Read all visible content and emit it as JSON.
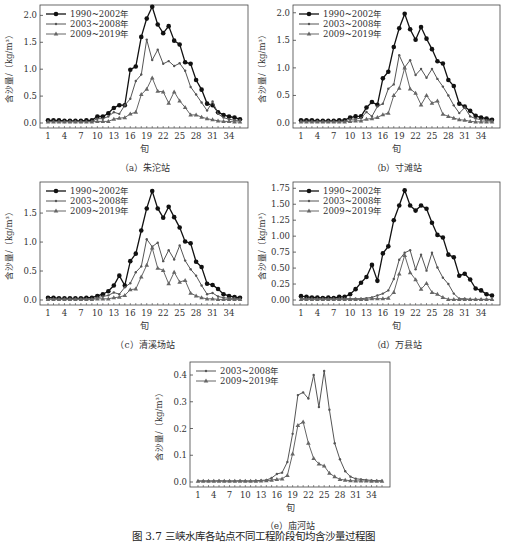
{
  "figure_caption": "图 3.7  三峡水库各站点不同工程阶段旬均含沙量过程图",
  "chart_data": [
    {
      "id": "a",
      "type": "line",
      "subtitle": "（a）朱沱站",
      "xlabel": "旬",
      "ylabel": "含沙量/（kg/m³）",
      "ylim": [
        0,
        2.1
      ],
      "yticks": [
        0.0,
        0.5,
        1.0,
        1.5,
        2.0
      ],
      "ytick_labels": [
        "0.0",
        "0.5",
        "1.0",
        "1.5",
        "2.0"
      ],
      "xticks": [
        1,
        4,
        7,
        10,
        13,
        16,
        19,
        22,
        25,
        28,
        31,
        34
      ],
      "x": [
        1,
        2,
        3,
        4,
        5,
        6,
        7,
        8,
        9,
        10,
        11,
        12,
        13,
        14,
        15,
        16,
        17,
        18,
        19,
        20,
        21,
        22,
        23,
        24,
        25,
        26,
        27,
        28,
        29,
        30,
        31,
        32,
        33,
        34,
        35,
        36
      ],
      "legend_position": "upper left",
      "grid": false,
      "series": [
        {
          "name": "1990~2002年",
          "marker": "circle",
          "values": [
            0.05,
            0.05,
            0.05,
            0.04,
            0.04,
            0.04,
            0.04,
            0.05,
            0.05,
            0.12,
            0.12,
            0.18,
            0.28,
            0.33,
            0.33,
            0.99,
            1.05,
            1.6,
            1.94,
            2.16,
            1.83,
            1.67,
            1.8,
            1.53,
            1.46,
            1.13,
            1.1,
            0.8,
            0.62,
            0.36,
            0.33,
            0.2,
            0.15,
            0.12,
            0.1,
            0.07
          ]
        },
        {
          "name": "2003~2008年",
          "marker": "small-dot",
          "values": [
            0.03,
            0.03,
            0.03,
            0.03,
            0.03,
            0.03,
            0.03,
            0.03,
            0.03,
            0.08,
            0.08,
            0.12,
            0.2,
            0.17,
            0.33,
            0.45,
            0.78,
            0.9,
            1.55,
            1.17,
            1.36,
            1.1,
            1.15,
            1.06,
            1.11,
            0.97,
            0.67,
            0.53,
            0.38,
            0.23,
            0.4,
            0.17,
            0.1,
            0.07,
            0.05,
            0.05
          ]
        },
        {
          "name": "2009~2019年",
          "marker": "triangle",
          "values": [
            0.02,
            0.02,
            0.02,
            0.02,
            0.02,
            0.02,
            0.02,
            0.02,
            0.02,
            0.03,
            0.03,
            0.03,
            0.07,
            0.09,
            0.1,
            0.17,
            0.2,
            0.53,
            0.63,
            0.84,
            0.59,
            0.58,
            0.37,
            0.58,
            0.41,
            0.29,
            0.15,
            0.15,
            0.11,
            0.08,
            0.06,
            0.04,
            0.03,
            0.03,
            0.02,
            0.02
          ]
        }
      ]
    },
    {
      "id": "b",
      "type": "line",
      "subtitle": "（b）寸滩站",
      "xlabel": "旬",
      "ylabel": "含沙量/（kg/m³）",
      "ylim": [
        0,
        2.05
      ],
      "yticks": [
        0.0,
        0.5,
        1.0,
        1.5,
        2.0
      ],
      "ytick_labels": [
        "0.0",
        "0.5",
        "1.0",
        "1.5",
        "2.0"
      ],
      "xticks": [
        1,
        4,
        7,
        10,
        13,
        16,
        19,
        22,
        25,
        28,
        31,
        34
      ],
      "x": [
        1,
        2,
        3,
        4,
        5,
        6,
        7,
        8,
        9,
        10,
        11,
        12,
        13,
        14,
        15,
        16,
        17,
        18,
        19,
        20,
        21,
        22,
        23,
        24,
        25,
        26,
        27,
        28,
        29,
        30,
        31,
        32,
        33,
        34,
        35,
        36
      ],
      "legend_position": "upper left",
      "grid": false,
      "series": [
        {
          "name": "1990~2002年",
          "marker": "circle",
          "values": [
            0.05,
            0.05,
            0.05,
            0.04,
            0.04,
            0.04,
            0.04,
            0.05,
            0.05,
            0.1,
            0.12,
            0.12,
            0.28,
            0.38,
            0.33,
            0.81,
            0.93,
            1.38,
            1.72,
            1.98,
            1.7,
            1.51,
            1.74,
            1.53,
            1.34,
            1.12,
            1.08,
            0.78,
            0.67,
            0.35,
            0.3,
            0.22,
            0.13,
            0.1,
            0.08,
            0.06
          ]
        },
        {
          "name": "2003~2008年",
          "marker": "small-dot",
          "values": [
            0.03,
            0.03,
            0.03,
            0.03,
            0.03,
            0.03,
            0.03,
            0.03,
            0.03,
            0.07,
            0.07,
            0.09,
            0.2,
            0.12,
            0.3,
            0.35,
            0.62,
            0.7,
            1.23,
            1.01,
            1.14,
            0.87,
            0.98,
            0.82,
            0.98,
            0.8,
            0.66,
            0.5,
            0.32,
            0.18,
            0.28,
            0.12,
            0.08,
            0.06,
            0.05,
            0.04
          ]
        },
        {
          "name": "2009~2019年",
          "marker": "triangle",
          "values": [
            0.02,
            0.02,
            0.02,
            0.02,
            0.02,
            0.02,
            0.02,
            0.02,
            0.02,
            0.03,
            0.04,
            0.04,
            0.07,
            0.08,
            0.1,
            0.15,
            0.18,
            0.5,
            0.63,
            1.0,
            0.62,
            0.54,
            0.33,
            0.5,
            0.36,
            0.4,
            0.16,
            0.12,
            0.09,
            0.06,
            0.05,
            0.03,
            0.02,
            0.02,
            0.02,
            0.02
          ]
        }
      ]
    },
    {
      "id": "c",
      "type": "line",
      "subtitle": "（c）清溪场站",
      "xlabel": "旬",
      "ylabel": "含沙量/（kg/m³）",
      "ylim": [
        0,
        1.95
      ],
      "yticks": [
        0.0,
        0.5,
        1.0,
        1.5
      ],
      "ytick_labels": [
        "0.0",
        "0.5",
        "1.0",
        "1.5"
      ],
      "xticks": [
        1,
        4,
        7,
        10,
        13,
        16,
        19,
        22,
        25,
        28,
        31,
        34
      ],
      "x": [
        1,
        2,
        3,
        4,
        5,
        6,
        7,
        8,
        9,
        10,
        11,
        12,
        13,
        14,
        15,
        16,
        17,
        18,
        19,
        20,
        21,
        22,
        23,
        24,
        25,
        26,
        27,
        28,
        29,
        30,
        31,
        32,
        33,
        34,
        35,
        36
      ],
      "legend_position": "upper left",
      "grid": false,
      "series": [
        {
          "name": "1990~2002年",
          "marker": "circle",
          "values": [
            0.04,
            0.04,
            0.03,
            0.03,
            0.03,
            0.03,
            0.03,
            0.04,
            0.04,
            0.07,
            0.1,
            0.15,
            0.25,
            0.42,
            0.25,
            0.67,
            0.8,
            1.2,
            1.58,
            1.88,
            1.58,
            1.42,
            1.61,
            1.43,
            1.25,
            1.01,
            0.98,
            0.66,
            0.57,
            0.28,
            0.26,
            0.19,
            0.1,
            0.07,
            0.05,
            0.04
          ]
        },
        {
          "name": "2003~2008年",
          "marker": "small-dot",
          "values": [
            0.02,
            0.02,
            0.02,
            0.02,
            0.02,
            0.02,
            0.02,
            0.02,
            0.02,
            0.04,
            0.06,
            0.08,
            0.13,
            0.1,
            0.22,
            0.29,
            0.48,
            0.58,
            1.05,
            0.92,
            0.99,
            0.67,
            0.86,
            0.7,
            0.94,
            0.68,
            0.53,
            0.42,
            0.25,
            0.1,
            0.12,
            0.06,
            0.04,
            0.03,
            0.03,
            0.02
          ]
        },
        {
          "name": "2009~2019年",
          "marker": "triangle",
          "values": [
            0.01,
            0.01,
            0.01,
            0.01,
            0.01,
            0.01,
            0.01,
            0.01,
            0.01,
            0.02,
            0.02,
            0.02,
            0.04,
            0.05,
            0.08,
            0.18,
            0.19,
            0.4,
            0.6,
            0.9,
            0.55,
            0.51,
            0.28,
            0.48,
            0.31,
            0.34,
            0.12,
            0.07,
            0.04,
            0.02,
            0.02,
            0.01,
            0.01,
            0.01,
            0.01,
            0.01
          ]
        }
      ]
    },
    {
      "id": "d",
      "type": "line",
      "subtitle": "（d）万县站",
      "xlabel": "旬",
      "ylabel": "含沙量/（kg/m³）",
      "ylim": [
        0,
        1.77
      ],
      "yticks": [
        0.0,
        0.25,
        0.5,
        0.75,
        1.0,
        1.25,
        1.5,
        1.75
      ],
      "ytick_labels": [
        "0.00",
        "0.25",
        "0.50",
        "0.75",
        "1.00",
        "1.25",
        "1.50",
        "1.75"
      ],
      "xticks": [
        1,
        4,
        7,
        10,
        13,
        16,
        19,
        22,
        25,
        28,
        31,
        34
      ],
      "x": [
        1,
        2,
        3,
        4,
        5,
        6,
        7,
        8,
        9,
        10,
        11,
        12,
        13,
        14,
        15,
        16,
        17,
        18,
        19,
        20,
        21,
        22,
        23,
        24,
        25,
        26,
        27,
        28,
        29,
        30,
        31,
        32,
        33,
        34,
        35,
        36
      ],
      "legend_position": "upper left",
      "grid": false,
      "series": [
        {
          "name": "1990~2002年",
          "marker": "circle",
          "values": [
            0.06,
            0.05,
            0.04,
            0.04,
            0.03,
            0.04,
            0.03,
            0.05,
            0.05,
            0.09,
            0.17,
            0.27,
            0.36,
            0.55,
            0.3,
            0.73,
            0.84,
            1.25,
            1.48,
            1.72,
            1.48,
            1.4,
            1.48,
            1.43,
            1.21,
            1.02,
            0.98,
            0.71,
            0.67,
            0.38,
            0.41,
            0.32,
            0.18,
            0.15,
            0.09,
            0.07
          ]
        },
        {
          "name": "2003~2008年",
          "marker": "small-dot",
          "values": [
            0.02,
            0.02,
            0.02,
            0.02,
            0.02,
            0.02,
            0.02,
            0.02,
            0.02,
            0.02,
            0.02,
            0.02,
            0.03,
            0.04,
            0.07,
            0.1,
            0.15,
            0.33,
            0.63,
            0.74,
            0.78,
            0.48,
            0.71,
            0.46,
            0.74,
            0.51,
            0.35,
            0.25,
            0.1,
            0.02,
            0.02,
            0.01,
            0.01,
            0.01,
            0.01,
            0.01
          ]
        },
        {
          "name": "2009~2019年",
          "marker": "triangle",
          "values": [
            0.01,
            0.01,
            0.01,
            0.01,
            0.01,
            0.01,
            0.01,
            0.01,
            0.01,
            0.01,
            0.01,
            0.01,
            0.01,
            0.02,
            0.02,
            0.02,
            0.03,
            0.12,
            0.41,
            0.7,
            0.43,
            0.32,
            0.17,
            0.26,
            0.12,
            0.09,
            0.04,
            0.01,
            0.01,
            0.01,
            0.01,
            0.01,
            0.01,
            0.01,
            0.01,
            0.01
          ]
        }
      ]
    },
    {
      "id": "e",
      "type": "line",
      "subtitle": "（e）庙河站",
      "xlabel": "旬",
      "ylabel": "含沙量/（kg/m³）",
      "ylim": [
        0,
        0.43
      ],
      "yticks": [
        0.0,
        0.1,
        0.2,
        0.3,
        0.4
      ],
      "ytick_labels": [
        "0.0",
        "0.1",
        "0.2",
        "0.3",
        "0.4"
      ],
      "xticks": [
        1,
        4,
        7,
        10,
        13,
        16,
        19,
        22,
        25,
        28,
        31,
        34
      ],
      "x": [
        1,
        2,
        3,
        4,
        5,
        6,
        7,
        8,
        9,
        10,
        11,
        12,
        13,
        14,
        15,
        16,
        17,
        18,
        19,
        20,
        21,
        22,
        23,
        24,
        25,
        26,
        27,
        28,
        29,
        30,
        31,
        32,
        33,
        34,
        35,
        36
      ],
      "legend_position": "upper left",
      "grid": false,
      "series": [
        {
          "name": "2003~2008年",
          "marker": "small-dot",
          "values": [
            0.004,
            0.004,
            0.004,
            0.004,
            0.005,
            0.004,
            0.004,
            0.004,
            0.005,
            0.004,
            0.004,
            0.005,
            0.006,
            0.007,
            0.015,
            0.03,
            0.035,
            0.075,
            0.18,
            0.325,
            0.335,
            0.312,
            0.4,
            0.28,
            0.415,
            0.27,
            0.145,
            0.085,
            0.04,
            0.02,
            0.012,
            0.01,
            0.008,
            0.006,
            0.005,
            0.005
          ]
        },
        {
          "name": "2009~2019年",
          "marker": "triangle",
          "values": [
            0.003,
            0.003,
            0.003,
            0.003,
            0.003,
            0.003,
            0.003,
            0.003,
            0.003,
            0.003,
            0.003,
            0.003,
            0.004,
            0.005,
            0.007,
            0.01,
            0.012,
            0.025,
            0.105,
            0.212,
            0.225,
            0.145,
            0.088,
            0.068,
            0.06,
            0.033,
            0.02,
            0.01,
            0.007,
            0.005,
            0.004,
            0.004,
            0.004,
            0.003,
            0.003,
            0.003
          ]
        }
      ]
    }
  ]
}
